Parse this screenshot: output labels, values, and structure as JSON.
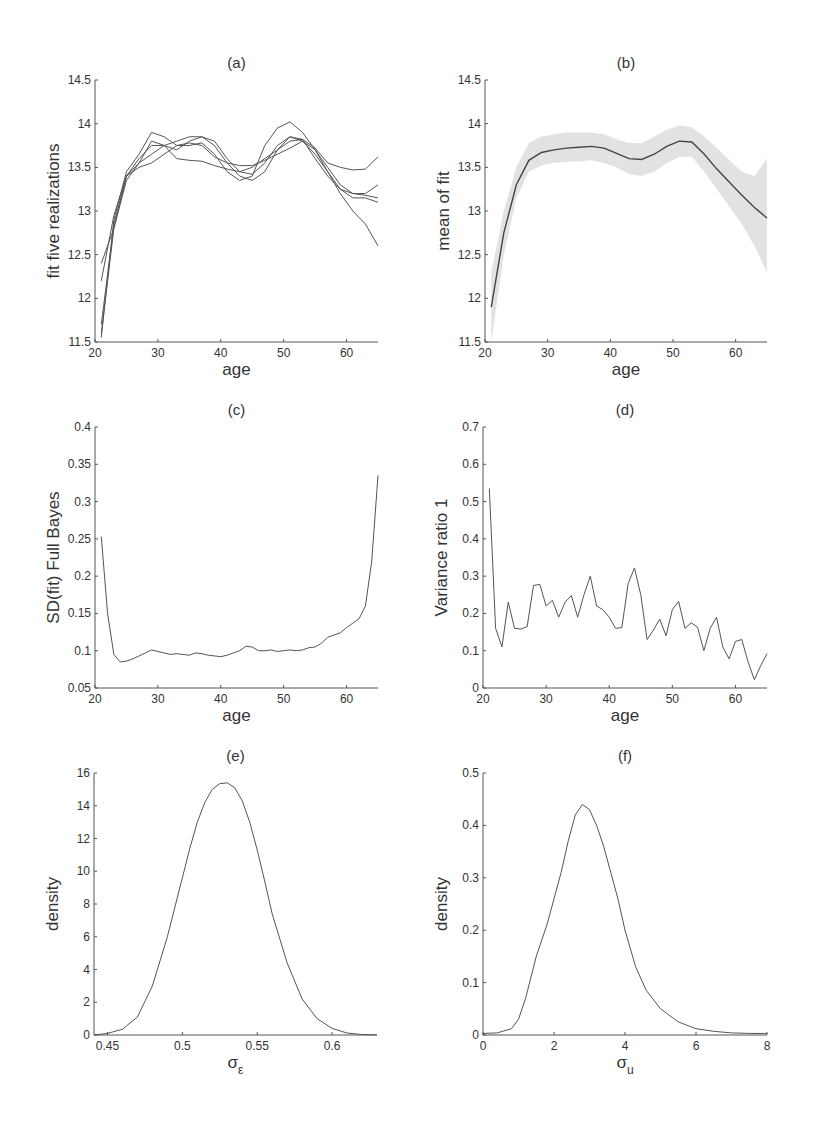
{
  "chart_data": [
    {
      "id": "a",
      "type": "line",
      "title": "(a)",
      "xlabel": "age",
      "ylabel": "fit  five realizations",
      "xlim": [
        20,
        65
      ],
      "ylim": [
        11.5,
        14.5
      ],
      "xticks": [
        20,
        30,
        40,
        50,
        60
      ],
      "yticks": [
        11.5,
        12,
        12.5,
        13,
        13.5,
        14,
        14.5
      ],
      "x": [
        21,
        23,
        25,
        27,
        29,
        31,
        33,
        35,
        37,
        39,
        41,
        43,
        45,
        47,
        49,
        51,
        53,
        55,
        57,
        59,
        61,
        63,
        65
      ],
      "series": [
        {
          "name": "realization 1",
          "values": [
            11.55,
            12.9,
            13.45,
            13.65,
            13.9,
            13.85,
            13.75,
            13.75,
            13.78,
            13.65,
            13.45,
            13.35,
            13.4,
            13.75,
            13.95,
            14.02,
            13.9,
            13.7,
            13.45,
            13.2,
            13.0,
            12.85,
            12.6
          ]
        },
        {
          "name": "realization 2",
          "values": [
            12.4,
            12.8,
            13.4,
            13.55,
            13.8,
            13.75,
            13.6,
            13.58,
            13.57,
            13.52,
            13.48,
            13.45,
            13.5,
            13.6,
            13.7,
            13.8,
            13.82,
            13.72,
            13.55,
            13.5,
            13.47,
            13.48,
            13.62
          ]
        },
        {
          "name": "realization 3",
          "values": [
            11.6,
            12.8,
            13.35,
            13.55,
            13.65,
            13.75,
            13.8,
            13.85,
            13.85,
            13.75,
            13.55,
            13.4,
            13.35,
            13.45,
            13.7,
            13.85,
            13.82,
            13.6,
            13.4,
            13.25,
            13.2,
            13.2,
            13.3
          ]
        },
        {
          "name": "realization 4",
          "values": [
            12.2,
            12.95,
            13.4,
            13.6,
            13.75,
            13.75,
            13.7,
            13.8,
            13.85,
            13.8,
            13.6,
            13.45,
            13.42,
            13.55,
            13.75,
            13.85,
            13.8,
            13.65,
            13.45,
            13.25,
            13.15,
            13.15,
            13.1
          ]
        },
        {
          "name": "realization 5",
          "values": [
            11.7,
            12.85,
            13.4,
            13.5,
            13.55,
            13.65,
            13.75,
            13.78,
            13.75,
            13.62,
            13.55,
            13.52,
            13.52,
            13.58,
            13.65,
            13.72,
            13.8,
            13.7,
            13.5,
            13.3,
            13.2,
            13.18,
            13.15
          ]
        }
      ]
    },
    {
      "id": "b",
      "type": "line",
      "title": "(b)",
      "xlabel": "age",
      "ylabel": "mean of fit",
      "xlim": [
        20,
        65
      ],
      "ylim": [
        11.5,
        14.5
      ],
      "xticks": [
        20,
        30,
        40,
        50,
        60
      ],
      "yticks": [
        11.5,
        12,
        12.5,
        13,
        13.5,
        14,
        14.5
      ],
      "x": [
        21,
        23,
        25,
        27,
        29,
        31,
        33,
        35,
        37,
        39,
        41,
        43,
        45,
        47,
        49,
        51,
        53,
        55,
        57,
        59,
        61,
        63,
        65
      ],
      "series": [
        {
          "name": "mean",
          "values": [
            11.9,
            12.75,
            13.3,
            13.58,
            13.67,
            13.7,
            13.72,
            13.73,
            13.74,
            13.72,
            13.66,
            13.6,
            13.59,
            13.65,
            13.74,
            13.8,
            13.79,
            13.65,
            13.48,
            13.33,
            13.18,
            13.04,
            12.92
          ]
        },
        {
          "name": "upper band",
          "values": [
            12.3,
            13.0,
            13.5,
            13.78,
            13.85,
            13.88,
            13.9,
            13.9,
            13.9,
            13.88,
            13.82,
            13.78,
            13.78,
            13.85,
            13.93,
            13.98,
            13.96,
            13.85,
            13.72,
            13.58,
            13.45,
            13.4,
            13.6
          ]
        },
        {
          "name": "lower band",
          "values": [
            11.5,
            12.5,
            13.15,
            13.45,
            13.52,
            13.55,
            13.56,
            13.57,
            13.58,
            13.55,
            13.5,
            13.42,
            13.4,
            13.45,
            13.55,
            13.62,
            13.62,
            13.45,
            13.25,
            13.05,
            12.85,
            12.6,
            12.3
          ]
        }
      ]
    },
    {
      "id": "c",
      "type": "line",
      "title": "(c)",
      "xlabel": "age",
      "ylabel": "SD(fit)  Full Bayes",
      "xlim": [
        20,
        65
      ],
      "ylim": [
        0.05,
        0.4
      ],
      "xticks": [
        20,
        30,
        40,
        50,
        60
      ],
      "yticks": [
        0.05,
        0.1,
        0.15,
        0.2,
        0.25,
        0.3,
        0.35,
        0.4
      ],
      "x": [
        21,
        22,
        23,
        24,
        25,
        26,
        27,
        28,
        29,
        30,
        31,
        32,
        33,
        34,
        35,
        36,
        37,
        38,
        39,
        40,
        41,
        42,
        43,
        44,
        45,
        46,
        47,
        48,
        49,
        50,
        51,
        52,
        53,
        54,
        55,
        56,
        57,
        58,
        59,
        60,
        61,
        62,
        63,
        64,
        65
      ],
      "series": [
        {
          "name": "SD",
          "values": [
            0.253,
            0.15,
            0.095,
            0.085,
            0.086,
            0.089,
            0.093,
            0.097,
            0.101,
            0.099,
            0.097,
            0.095,
            0.096,
            0.095,
            0.094,
            0.097,
            0.096,
            0.094,
            0.093,
            0.092,
            0.094,
            0.097,
            0.1,
            0.106,
            0.105,
            0.1,
            0.1,
            0.101,
            0.099,
            0.1,
            0.101,
            0.1,
            0.101,
            0.104,
            0.105,
            0.11,
            0.118,
            0.121,
            0.124,
            0.131,
            0.137,
            0.143,
            0.16,
            0.22,
            0.335
          ]
        }
      ]
    },
    {
      "id": "d",
      "type": "line",
      "title": "(d)",
      "xlabel": "age",
      "ylabel": "Variance ratio  1",
      "xlim": [
        20,
        65
      ],
      "ylim": [
        0,
        0.7
      ],
      "xticks": [
        20,
        30,
        40,
        50,
        60
      ],
      "yticks": [
        0,
        0.1,
        0.2,
        0.3,
        0.4,
        0.5,
        0.6,
        0.7
      ],
      "x": [
        21,
        22,
        23,
        24,
        25,
        26,
        27,
        28,
        29,
        30,
        31,
        32,
        33,
        34,
        35,
        36,
        37,
        38,
        39,
        40,
        41,
        42,
        43,
        44,
        45,
        46,
        47,
        48,
        49,
        50,
        51,
        52,
        53,
        54,
        55,
        56,
        57,
        58,
        59,
        60,
        61,
        62,
        63,
        64,
        65
      ],
      "series": [
        {
          "name": "variance ratio",
          "values": [
            0.535,
            0.16,
            0.11,
            0.23,
            0.16,
            0.158,
            0.165,
            0.275,
            0.278,
            0.22,
            0.235,
            0.19,
            0.23,
            0.248,
            0.19,
            0.25,
            0.3,
            0.22,
            0.21,
            0.19,
            0.16,
            0.162,
            0.28,
            0.322,
            0.25,
            0.13,
            0.155,
            0.185,
            0.14,
            0.21,
            0.232,
            0.16,
            0.175,
            0.163,
            0.1,
            0.16,
            0.19,
            0.11,
            0.078,
            0.125,
            0.13,
            0.07,
            0.022,
            0.06,
            0.092
          ]
        }
      ]
    },
    {
      "id": "e",
      "type": "line",
      "title": "(e)",
      "xlabel": "σ",
      "xlabel_sub": "ε",
      "ylabel": "density",
      "xlim": [
        0.441,
        0.63
      ],
      "ylim": [
        0,
        16
      ],
      "xticks": [
        0.45,
        0.5,
        0.55,
        0.6
      ],
      "yticks": [
        0,
        2,
        4,
        6,
        8,
        10,
        12,
        14,
        16
      ],
      "x": [
        0.441,
        0.45,
        0.46,
        0.47,
        0.48,
        0.49,
        0.5,
        0.505,
        0.51,
        0.515,
        0.52,
        0.525,
        0.53,
        0.535,
        0.54,
        0.545,
        0.55,
        0.555,
        0.56,
        0.57,
        0.58,
        0.59,
        0.6,
        0.61,
        0.62,
        0.63
      ],
      "series": [
        {
          "name": "posterior density",
          "values": [
            0.0,
            0.1,
            0.35,
            1.1,
            3.0,
            6.0,
            9.6,
            11.4,
            13.0,
            14.2,
            15.0,
            15.35,
            15.4,
            15.1,
            14.3,
            13.0,
            11.3,
            9.4,
            7.4,
            4.4,
            2.2,
            1.0,
            0.4,
            0.12,
            0.03,
            0.0
          ]
        }
      ]
    },
    {
      "id": "f",
      "type": "line",
      "title": "(f)",
      "xlabel": "σ",
      "xlabel_sub": "u",
      "ylabel": "density",
      "xlim": [
        0,
        8
      ],
      "ylim": [
        0,
        0.5
      ],
      "xticks": [
        0,
        2,
        4,
        6,
        8
      ],
      "yticks": [
        0,
        0.1,
        0.2,
        0.3,
        0.4,
        0.5
      ],
      "x": [
        0,
        0.4,
        0.8,
        1.0,
        1.2,
        1.5,
        1.8,
        2.0,
        2.2,
        2.4,
        2.6,
        2.8,
        3.0,
        3.2,
        3.4,
        3.6,
        3.8,
        4.0,
        4.3,
        4.6,
        5.0,
        5.5,
        6.0,
        6.5,
        7.0,
        7.5,
        8.0
      ],
      "series": [
        {
          "name": "posterior density",
          "values": [
            0.003,
            0.004,
            0.012,
            0.03,
            0.07,
            0.15,
            0.21,
            0.26,
            0.31,
            0.37,
            0.42,
            0.44,
            0.43,
            0.4,
            0.36,
            0.31,
            0.26,
            0.2,
            0.13,
            0.085,
            0.05,
            0.025,
            0.012,
            0.007,
            0.004,
            0.003,
            0.003
          ]
        }
      ]
    }
  ]
}
